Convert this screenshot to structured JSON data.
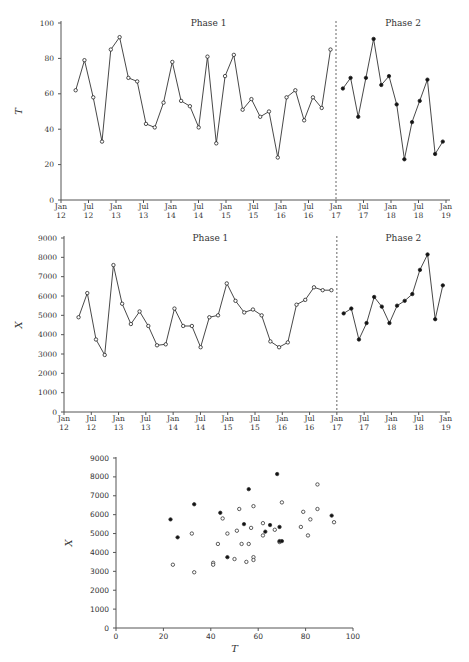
{
  "chart_data": [
    {
      "type": "line",
      "title": "",
      "xlabel": "",
      "ylabel": "T",
      "ylim": [
        0,
        100
      ],
      "yticks": [
        "0",
        "20",
        "40",
        "60",
        "80",
        "100"
      ],
      "xticks": [
        {
          "top": "Jan",
          "bottom": "12"
        },
        {
          "top": "Jul",
          "bottom": "12"
        },
        {
          "top": "Jan",
          "bottom": "13"
        },
        {
          "top": "Jul",
          "bottom": "13"
        },
        {
          "top": "Jan",
          "bottom": "14"
        },
        {
          "top": "Jul",
          "bottom": "14"
        },
        {
          "top": "Jan",
          "bottom": "15"
        },
        {
          "top": "Jul",
          "bottom": "15"
        },
        {
          "top": "Jan",
          "bottom": "16"
        },
        {
          "top": "Jul",
          "bottom": "16"
        },
        {
          "top": "Jan",
          "bottom": "17"
        },
        {
          "top": "Jul",
          "bottom": "17"
        },
        {
          "top": "Jan",
          "bottom": "18"
        },
        {
          "top": "Jul",
          "bottom": "18"
        },
        {
          "top": "Jan",
          "bottom": "19"
        }
      ],
      "annotations": [
        "Phase 1",
        "Phase 2"
      ],
      "divider_at": "Jan 17",
      "series": [
        {
          "name": "Phase 1",
          "marker": "open",
          "values": [
            62,
            79,
            58,
            33,
            85,
            92,
            69,
            67,
            43,
            41,
            55,
            78,
            56,
            53,
            41,
            81,
            32,
            70,
            82,
            51,
            57,
            47,
            50,
            24,
            58,
            62,
            45,
            58,
            52,
            85
          ]
        },
        {
          "name": "Phase 2",
          "marker": "filled",
          "values": [
            63,
            69,
            47,
            69,
            91,
            65,
            70,
            54,
            23,
            44,
            56,
            68,
            26,
            33
          ]
        }
      ]
    },
    {
      "type": "line",
      "title": "",
      "xlabel": "",
      "ylabel": "X",
      "ylim": [
        0,
        9000
      ],
      "yticks": [
        "0",
        "1000",
        "2000",
        "3000",
        "4000",
        "5000",
        "6000",
        "7000",
        "8000",
        "9000"
      ],
      "xticks": [
        {
          "top": "Jan",
          "bottom": "12"
        },
        {
          "top": "Jul",
          "bottom": "12"
        },
        {
          "top": "Jan",
          "bottom": "13"
        },
        {
          "top": "Jul",
          "bottom": "13"
        },
        {
          "top": "Jan",
          "bottom": "14"
        },
        {
          "top": "Jul",
          "bottom": "14"
        },
        {
          "top": "Jan",
          "bottom": "15"
        },
        {
          "top": "Jul",
          "bottom": "15"
        },
        {
          "top": "Jan",
          "bottom": "16"
        },
        {
          "top": "Jul",
          "bottom": "16"
        },
        {
          "top": "Jan",
          "bottom": "17"
        },
        {
          "top": "Jul",
          "bottom": "17"
        },
        {
          "top": "Jan",
          "bottom": "18"
        },
        {
          "top": "Jul",
          "bottom": "18"
        },
        {
          "top": "Jan",
          "bottom": "19"
        }
      ],
      "annotations": [
        "Phase 1",
        "Phase 2"
      ],
      "divider_at": "Jan 17",
      "series": [
        {
          "name": "Phase 1",
          "marker": "open",
          "values": [
            4900,
            6150,
            3750,
            2950,
            7600,
            5600,
            4550,
            5200,
            4450,
            3450,
            3500,
            5350,
            4450,
            4450,
            3350,
            4900,
            5000,
            6650,
            5750,
            5150,
            5300,
            5000,
            3650,
            3350,
            3600,
            5550,
            5800,
            6450,
            6300,
            6300
          ]
        },
        {
          "name": "Phase 2",
          "marker": "filled",
          "values": [
            5100,
            5350,
            3750,
            4600,
            5950,
            5450,
            4600,
            5500,
            5750,
            6100,
            7350,
            8150,
            4800,
            6550
          ]
        }
      ]
    },
    {
      "type": "scatter",
      "title": "",
      "xlabel": "T",
      "ylabel": "X",
      "xlim": [
        0,
        100
      ],
      "ylim": [
        0,
        9000
      ],
      "xticks": [
        "0",
        "20",
        "40",
        "60",
        "80",
        "100"
      ],
      "yticks": [
        "0",
        "1000",
        "2000",
        "3000",
        "4000",
        "5000",
        "6000",
        "7000",
        "8000",
        "9000"
      ],
      "series": [
        {
          "name": "Phase 1",
          "marker": "open",
          "pairs_from": "chart 1 & 2 Phase 1"
        },
        {
          "name": "Phase 2",
          "marker": "filled",
          "pairs_from": "chart 1 & 2 Phase 2"
        }
      ]
    }
  ]
}
